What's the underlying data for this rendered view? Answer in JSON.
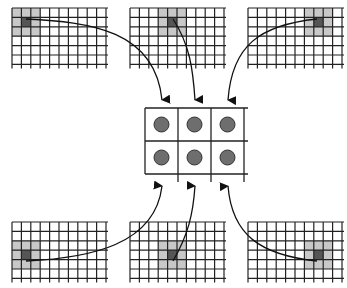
{
  "diagram": {
    "colors": {
      "grid_line": "#222222",
      "highlight": "#c8c8c8",
      "center_cell": "#555555",
      "neuron_fill": "#6e6e6e",
      "arrow": "#111111",
      "background": "#ffffff"
    },
    "input_grids": [
      {
        "id": "top-left",
        "x": 12,
        "y": 8,
        "cols": 10,
        "rows": 6,
        "cell": 9.4,
        "hl_col": 0,
        "hl_row": 0,
        "center_col": 1,
        "center_row": 1
      },
      {
        "id": "top-center",
        "x": 130,
        "y": 8,
        "cols": 10,
        "rows": 6,
        "cell": 9.4,
        "hl_col": 3,
        "hl_row": 0,
        "center_col": 4,
        "center_row": 1
      },
      {
        "id": "top-right",
        "x": 248,
        "y": 8,
        "cols": 10,
        "rows": 6,
        "cell": 9.4,
        "hl_col": 6,
        "hl_row": 0,
        "center_col": 7,
        "center_row": 1
      },
      {
        "id": "bottom-left",
        "x": 12,
        "y": 222,
        "cols": 10,
        "rows": 6,
        "cell": 9.4,
        "hl_col": 0,
        "hl_row": 2,
        "center_col": 1,
        "center_row": 3
      },
      {
        "id": "bottom-center",
        "x": 130,
        "y": 222,
        "cols": 10,
        "rows": 6,
        "cell": 9.4,
        "hl_col": 3,
        "hl_row": 2,
        "center_col": 4,
        "center_row": 3
      },
      {
        "id": "bottom-right",
        "x": 248,
        "y": 222,
        "cols": 10,
        "rows": 6,
        "cell": 9.4,
        "hl_col": 6,
        "hl_row": 2,
        "center_col": 7,
        "center_row": 3
      }
    ],
    "output_grid": {
      "x": 145,
      "y": 108,
      "cols": 3,
      "rows": 2,
      "cell": 33,
      "neuron_radius": 7.5
    },
    "arrows": [
      {
        "from": "top-left",
        "path": "M26,19 C90,22 155,30 162,100"
      },
      {
        "from": "top-center",
        "path": "M173,19 C190,45 193,70 195,100"
      },
      {
        "from": "top-right",
        "path": "M317,19 C260,25 232,45 228,100"
      },
      {
        "from": "bottom-left",
        "path": "M26,261 C90,258 155,245 162,186"
      },
      {
        "from": "bottom-center",
        "path": "M173,261 C188,235 193,215 195,186"
      },
      {
        "from": "bottom-right",
        "path": "M317,261 C260,255 232,235 228,186"
      }
    ]
  }
}
